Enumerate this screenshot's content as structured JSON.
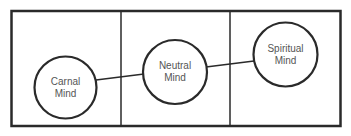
{
  "diagram": {
    "title": "",
    "colors": {
      "stroke": "#2a2a2a",
      "text": "#555555",
      "background": "#ffffff"
    },
    "frame": {
      "columns": 3
    },
    "nodes": [
      {
        "id": "carnal",
        "line1": "Carnal",
        "line2": "Mind"
      },
      {
        "id": "neutral",
        "line1": "Neutral",
        "line2": "Mind"
      },
      {
        "id": "spiritual",
        "line1": "Spiritual",
        "line2": "Mind"
      }
    ],
    "edges": [
      {
        "from": "carnal",
        "to": "neutral"
      },
      {
        "from": "neutral",
        "to": "spiritual"
      }
    ]
  }
}
